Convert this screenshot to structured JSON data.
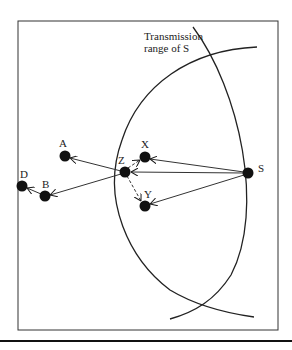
{
  "diagram": {
    "caption": {
      "line1": "Transmission",
      "line2": "range of S"
    },
    "nodes": [
      {
        "id": "S",
        "label": "S",
        "x": 248,
        "y": 173
      },
      {
        "id": "Z",
        "label": "Z",
        "x": 125,
        "y": 172
      },
      {
        "id": "X",
        "label": "X",
        "x": 145,
        "y": 157
      },
      {
        "id": "Y",
        "label": "Y",
        "x": 145,
        "y": 206
      },
      {
        "id": "A",
        "label": "A",
        "x": 65,
        "y": 156
      },
      {
        "id": "B",
        "label": "B",
        "x": 45,
        "y": 196
      },
      {
        "id": "D",
        "label": "D",
        "x": 22,
        "y": 186
      }
    ],
    "edges": [
      {
        "from": "S",
        "to": "X",
        "style": "solid"
      },
      {
        "from": "S",
        "to": "Z",
        "style": "solid"
      },
      {
        "from": "S",
        "to": "Y",
        "style": "solid"
      },
      {
        "from": "Z",
        "to": "A",
        "style": "solid"
      },
      {
        "from": "Z",
        "to": "B",
        "style": "solid"
      },
      {
        "from": "B",
        "to": "D",
        "style": "solid"
      },
      {
        "from": "Z",
        "to": "X",
        "style": "dashed"
      },
      {
        "from": "Z",
        "to": "Y",
        "style": "dashed"
      }
    ],
    "colors": {
      "ink": "#1a1a1a",
      "background": "#ffffff"
    }
  }
}
